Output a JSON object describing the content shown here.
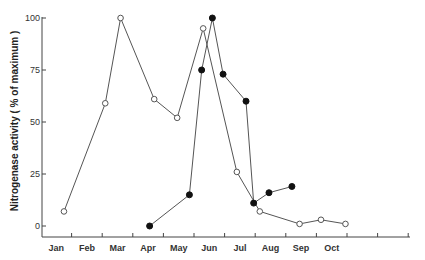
{
  "chart_data": {
    "type": "line",
    "title": "",
    "xlabel": "",
    "ylabel": "Nitrogenase activity ( % of maximum )",
    "ylim": [
      0,
      100
    ],
    "yticks": [
      0,
      25,
      50,
      75,
      100
    ],
    "categories": [
      "Jan",
      "Feb",
      "Mar",
      "Apr",
      "May",
      "Jun",
      "Jul",
      "Aug",
      "Sep",
      "Oct",
      "",
      ""
    ],
    "grid": false,
    "legend": null,
    "series": [
      {
        "name": "open circles",
        "marker": "open-circle",
        "points": [
          {
            "x": 0.75,
            "y": 7
          },
          {
            "x": 2.1,
            "y": 59
          },
          {
            "x": 2.6,
            "y": 100
          },
          {
            "x": 3.7,
            "y": 61
          },
          {
            "x": 4.45,
            "y": 52
          },
          {
            "x": 5.3,
            "y": 95
          },
          {
            "x": 6.4,
            "y": 26
          },
          {
            "x": 7.15,
            "y": 7
          },
          {
            "x": 8.45,
            "y": 1
          },
          {
            "x": 9.15,
            "y": 3
          },
          {
            "x": 9.95,
            "y": 1
          }
        ]
      },
      {
        "name": "filled circles",
        "marker": "filled-circle",
        "points": [
          {
            "x": 3.55,
            "y": 0
          },
          {
            "x": 4.85,
            "y": 15
          },
          {
            "x": 5.25,
            "y": 75
          },
          {
            "x": 5.6,
            "y": 100
          },
          {
            "x": 5.95,
            "y": 73
          },
          {
            "x": 6.7,
            "y": 60
          },
          {
            "x": 6.95,
            "y": 11
          },
          {
            "x": 7.45,
            "y": 16
          },
          {
            "x": 8.2,
            "y": 19
          }
        ]
      }
    ]
  },
  "axis": {
    "ylabel": "Nitrogenase activity ( % of maximum )",
    "yticks": [
      "0",
      "25",
      "50",
      "75",
      "100"
    ],
    "xticks": [
      "Jan",
      "Feb",
      "Mar",
      "Apr",
      "May",
      "Jun",
      "Jul",
      "Aug",
      "Sep",
      "Oct"
    ]
  }
}
